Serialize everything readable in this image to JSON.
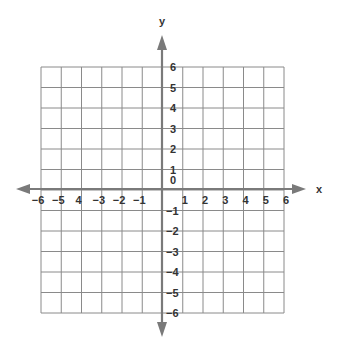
{
  "title": "",
  "axes": {
    "x_label": "x",
    "y_label": "y",
    "x_range": [
      -6,
      6
    ],
    "y_range": [
      -6,
      6
    ],
    "origin_label": "0",
    "x_tick_labels": [
      "−6",
      "−5",
      "4",
      "−3",
      "−2",
      "−1",
      "1",
      "2",
      "3",
      "4",
      "5",
      "6"
    ],
    "y_tick_labels_positive": [
      "1",
      "2",
      "3",
      "4",
      "5",
      "6"
    ],
    "y_tick_labels_negative": [
      "−1",
      "−2",
      "−3",
      "−4",
      "−5",
      "−6"
    ]
  },
  "colors": {
    "grid": "#8a8a8a",
    "axis": "#7a7a7a",
    "text": "#333333",
    "background": "#ffffff"
  },
  "chart_data": {
    "type": "coordinate-grid",
    "title": "",
    "xlabel": "x",
    "ylabel": "y",
    "xlim": [
      -6,
      6
    ],
    "ylim": [
      -6,
      6
    ],
    "grid": true,
    "grid_step": 1,
    "series": []
  }
}
